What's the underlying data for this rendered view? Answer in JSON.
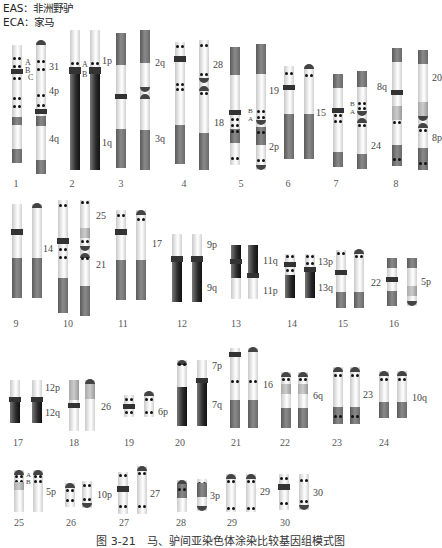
{
  "legend": {
    "line1": "EAS：非洲野驴",
    "line2": "ECA：家马"
  },
  "caption": "图 3-21　马、驴间亚染色体涂染比较基因组模式图",
  "pairs": [
    {
      "id": "1",
      "eca_labels": [
        "31",
        "4p",
        "4q"
      ],
      "markers": [
        "A",
        "B",
        "C"
      ]
    },
    {
      "id": "2",
      "eca_labels": [
        "1p",
        "1q"
      ],
      "markers": [
        "A",
        "B"
      ]
    },
    {
      "id": "3",
      "eca_labels": [
        "2q",
        "3q"
      ]
    },
    {
      "id": "4",
      "eca_labels": [
        "28"
      ]
    },
    {
      "id": "5",
      "eca_labels": [
        "18",
        "2p"
      ],
      "markers": [
        "B",
        "A"
      ]
    },
    {
      "id": "6",
      "eca_labels": [
        "19"
      ]
    },
    {
      "id": "7",
      "eca_labels": [
        "15",
        "24"
      ],
      "markers": [
        "B",
        "A"
      ]
    },
    {
      "id": "8",
      "eca_labels": [
        "8q",
        "20",
        "8p"
      ]
    },
    {
      "id": "9",
      "eca_labels": []
    },
    {
      "id": "10",
      "eca_labels": [
        "14",
        "25",
        "21"
      ]
    },
    {
      "id": "11",
      "eca_labels": [
        "17"
      ]
    },
    {
      "id": "12",
      "eca_labels": [
        "9p",
        "9q"
      ]
    },
    {
      "id": "13",
      "eca_labels": [
        "11q",
        "11p"
      ]
    },
    {
      "id": "14",
      "eca_labels": [
        "13p",
        "13q"
      ]
    },
    {
      "id": "15",
      "eca_labels": [
        "22"
      ]
    },
    {
      "id": "16",
      "eca_labels": [
        "5p"
      ]
    },
    {
      "id": "17",
      "eca_labels": [
        "12p",
        "12q"
      ]
    },
    {
      "id": "18",
      "eca_labels": [
        "26"
      ]
    },
    {
      "id": "19",
      "eca_labels": [
        "6p"
      ]
    },
    {
      "id": "20",
      "eca_labels": [
        "7p",
        "7q"
      ]
    },
    {
      "id": "21",
      "eca_labels": [
        "16"
      ]
    },
    {
      "id": "22",
      "eca_labels": [
        "6q"
      ]
    },
    {
      "id": "23",
      "eca_labels": [
        "23"
      ]
    },
    {
      "id": "24",
      "eca_labels": [
        "10q"
      ]
    },
    {
      "id": "25",
      "eca_labels": [
        "5p"
      ],
      "markers": [
        "A",
        "B"
      ]
    },
    {
      "id": "26",
      "eca_labels": [
        "10p"
      ]
    },
    {
      "id": "27",
      "eca_labels": [
        "27"
      ]
    },
    {
      "id": "28",
      "eca_labels": [
        "3p"
      ]
    },
    {
      "id": "29",
      "eca_labels": [
        "29"
      ]
    },
    {
      "id": "30",
      "eca_labels": [
        "30"
      ]
    }
  ],
  "labels": {
    "p1_31": "31",
    "p1_4p": "4p",
    "p1_4q": "4q",
    "p1_A": "A",
    "p1_B": "B",
    "p1_C": "C",
    "p2_1p": "1p",
    "p2_1q": "1q",
    "p2_A": "A",
    "p2_B": "B",
    "p3_2q": "2q",
    "p3_3q": "3q",
    "p4_28": "28",
    "p5_18": "18",
    "p5_2p": "2p",
    "p5_B": "B",
    "p5_A": "A",
    "p6_19": "19",
    "p7_15": "15",
    "p7_24": "24",
    "p7_B": "B",
    "p7_A": "A",
    "p8_8q": "8q",
    "p8_20": "20",
    "p8_8p": "8p",
    "p10_14": "14",
    "p10_25": "25",
    "p10_21": "21",
    "p11_17": "17",
    "p12_9p": "9p",
    "p12_9q": "9q",
    "p13_11q": "11q",
    "p13_11p": "11p",
    "p14_13p": "13p",
    "p14_13q": "13q",
    "p15_22": "22",
    "p16_5p": "5p",
    "p17_12p": "12p",
    "p17_12q": "12q",
    "p18_26": "26",
    "p19_6p": "6p",
    "p20_7p": "7p",
    "p20_7q": "7q",
    "p21_16": "16",
    "p22_6q": "6q",
    "p23_23": "23",
    "p24_10q": "10q",
    "p25_5p": "5p",
    "p25_A": "A",
    "p25_B": "B",
    "p26_10p": "10p",
    "p27_27": "27",
    "p28_3p": "3p",
    "p29_29": "29",
    "p30_30": "30"
  },
  "numbers": [
    "1",
    "2",
    "3",
    "4",
    "5",
    "6",
    "7",
    "8",
    "9",
    "10",
    "11",
    "12",
    "13",
    "14",
    "15",
    "16",
    "17",
    "18",
    "19",
    "20",
    "21",
    "22",
    "23",
    "24",
    "25",
    "26",
    "27",
    "28",
    "29",
    "30"
  ]
}
